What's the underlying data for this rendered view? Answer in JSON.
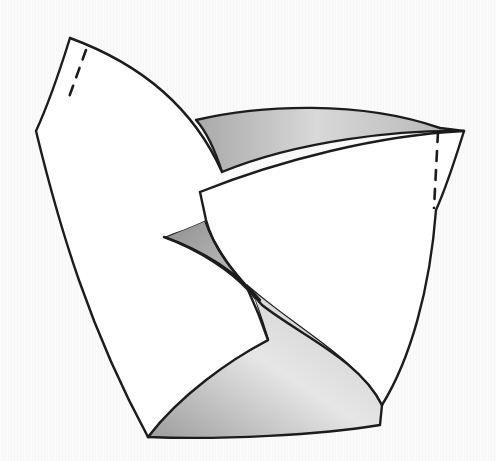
{
  "figure": {
    "type": "hand-drawn sketch",
    "colors": {
      "background": "#f8f8f8",
      "paper": "#ffffff",
      "ink": "#1c1c1c",
      "shade_dark": "#9a9a9a",
      "shade_light": "#e2e2e2"
    },
    "panels": [
      {
        "name": "left-petal",
        "fill": "paper"
      },
      {
        "name": "right-petal",
        "fill": "paper"
      },
      {
        "name": "back-inner-surface",
        "fill": "shaded"
      },
      {
        "name": "center-inner-fold",
        "fill": "shaded"
      },
      {
        "name": "bottom-inner-surface",
        "fill": "shaded"
      }
    ],
    "dashed_fold_lines": 2
  }
}
